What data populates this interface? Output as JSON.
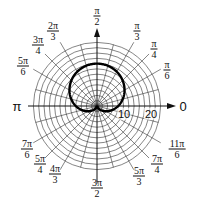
{
  "graph": {
    "type": "polar",
    "curve": "cardioid r = 8 + 8 sin θ",
    "curve_params": {
      "a": 8,
      "b": 8
    },
    "radial_scale_labels": [
      "10",
      "20"
    ],
    "ring_step": 2,
    "ring_max": 24,
    "spoke_step_deg": 15,
    "angle_labels": [
      {
        "num": "π",
        "den": "2",
        "deg": 90
      },
      {
        "num": "π",
        "den": "3",
        "deg": 60
      },
      {
        "num": "π",
        "den": "4",
        "deg": 45
      },
      {
        "num": "π",
        "den": "6",
        "deg": 30
      },
      {
        "num": "2π",
        "den": "3",
        "deg": 120
      },
      {
        "num": "3π",
        "den": "4",
        "deg": 135
      },
      {
        "num": "5π",
        "den": "6",
        "deg": 150
      },
      {
        "num": "7π",
        "den": "6",
        "deg": 210
      },
      {
        "num": "5π",
        "den": "4",
        "deg": 225
      },
      {
        "num": "4π",
        "den": "3",
        "deg": 240
      },
      {
        "num": "3π",
        "den": "2",
        "deg": 270
      },
      {
        "num": "5π",
        "den": "3",
        "deg": 300
      },
      {
        "num": "7π",
        "den": "4",
        "deg": 315
      },
      {
        "num": "11π",
        "den": "6",
        "deg": 330
      }
    ],
    "axis_labels": {
      "pi": "π",
      "zero": "0"
    }
  }
}
